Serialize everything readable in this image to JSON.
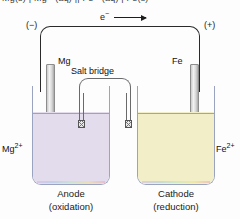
{
  "figure": {
    "type": "galvanic-cell-diagram",
    "clipped_top_equation": "Mg(s) | Mg²⁺(aq) || Fe²⁺(aq) | Fe(s)",
    "terminals": {
      "negative": "(−)",
      "positive": "(+)"
    },
    "electron_flow": {
      "label": "e",
      "charge": "−",
      "direction": "left-to-right"
    },
    "salt_bridge": {
      "label": "Salt bridge"
    },
    "left_cell": {
      "electrode_label": "Mg",
      "ion_label": "Mg",
      "ion_charge": "2+",
      "caption_title": "Anode",
      "caption_sub": "(oxidation)",
      "solution_color": "#e3dcec"
    },
    "right_cell": {
      "electrode_label": "Fe",
      "ion_label": "Fe",
      "ion_charge": "2+",
      "caption_title": "Cathode",
      "caption_sub": "(reduction)",
      "solution_color": "#f2efc8"
    },
    "colors": {
      "wire": "#2a2a2a",
      "glass": "#9aa3c0",
      "electrode_metal": "#c9c9c9"
    }
  }
}
